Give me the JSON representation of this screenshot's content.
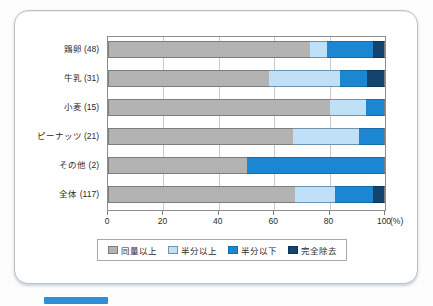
{
  "chart_data": {
    "type": "bar",
    "orientation": "horizontal",
    "stacked": true,
    "normalized": true,
    "title": "",
    "xlabel": "(%)",
    "ylabel": "",
    "xlim": [
      0,
      100
    ],
    "xticks": [
      "0",
      "20",
      "40",
      "60",
      "80",
      "100"
    ],
    "xtick_values": [
      0,
      20,
      40,
      60,
      80,
      100
    ],
    "grid": "vertical",
    "legend_position": "bottom",
    "categories": [
      "鶏卵 (48)",
      "牛乳 (31)",
      "小麦 (15)",
      "ピーナッツ (21)",
      "その他 (2)",
      "全体 (117)"
    ],
    "series": [
      {
        "name": "同量以上",
        "color": "#b3b3b3",
        "values": [
          72.9,
          58.1,
          80.0,
          66.7,
          50.0,
          67.5
        ]
      },
      {
        "name": "半分以上",
        "color": "#bfe0f7",
        "values": [
          6.3,
          25.8,
          13.3,
          23.8,
          0.0,
          14.5
        ]
      },
      {
        "name": "半分以下",
        "color": "#1b87d2",
        "values": [
          16.6,
          9.7,
          6.7,
          9.5,
          50.0,
          13.7
        ]
      },
      {
        "name": "完全除去",
        "color": "#12446e",
        "values": [
          4.2,
          6.4,
          0.0,
          0.0,
          0.0,
          4.3
        ]
      }
    ]
  },
  "axis": {
    "x_unit": "(%)",
    "ticks": [
      "0",
      "20",
      "40",
      "60",
      "80",
      "100"
    ]
  },
  "legend": {
    "items": [
      {
        "label": "同量以上",
        "color": "#b3b3b3"
      },
      {
        "label": "半分以上",
        "color": "#bfe0f7"
      },
      {
        "label": "半分以下",
        "color": "#1b87d2"
      },
      {
        "label": "完全除去",
        "color": "#12446e"
      }
    ]
  },
  "caption": {
    "badge_label": "",
    "text": ""
  }
}
